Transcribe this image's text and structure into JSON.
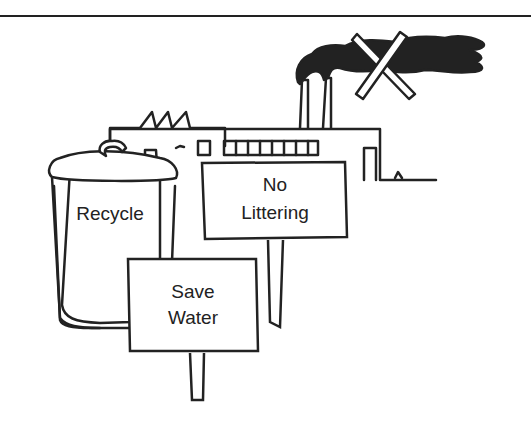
{
  "illustration": {
    "subject": "environmental protection scene",
    "trash_can": {
      "label": "Recycle"
    },
    "sign_1": {
      "label_line1": "No",
      "label_line2": "Littering"
    },
    "sign_2": {
      "label_line1": "Save",
      "label_line2": "Water"
    },
    "factory": {
      "smoke": "crossed-out"
    }
  },
  "colors": {
    "ink": "#222222",
    "paper": "#ffffff"
  }
}
